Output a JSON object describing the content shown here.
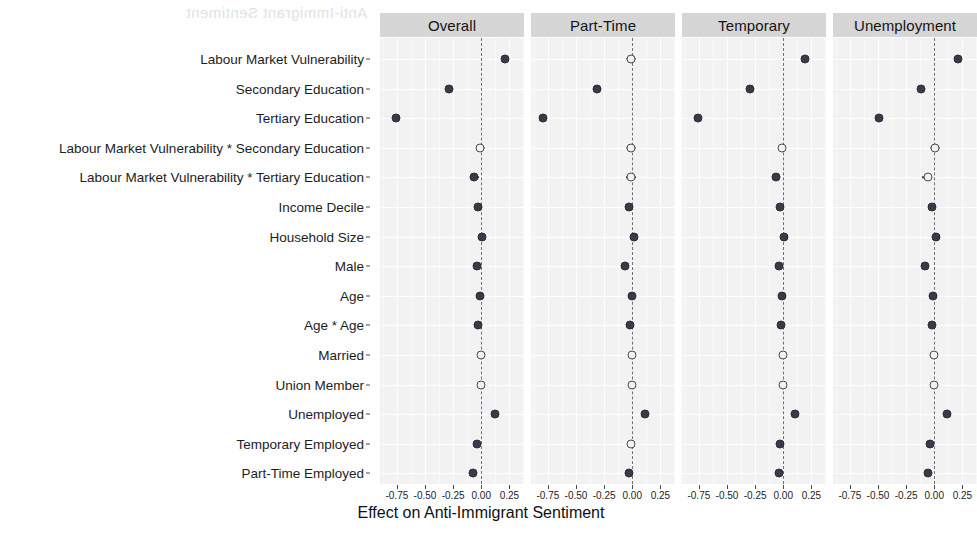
{
  "chart_data": {
    "type": "scatter",
    "plot_style": "coefficient-plot",
    "title": "",
    "xlabel": "Effect on Anti-Immigrant Sentiment",
    "ylabel": "",
    "xlim": [
      -0.9,
      0.38
    ],
    "xticks": [
      -0.75,
      -0.5,
      -0.25,
      0.0,
      0.25
    ],
    "xtick_labels": [
      "-0.75",
      "-0.50",
      "-0.25",
      "0.00",
      "0.25"
    ],
    "grid": true,
    "legend": "none",
    "reference_line": 0.0,
    "reference_line_style": "dashed",
    "marker_legend": {
      "filled": "significant",
      "open": "not significant"
    },
    "categories": [
      "Labour Market Vulnerability",
      "Secondary Education",
      "Tertiary Education",
      "Labour Market Vulnerability * Secondary Education",
      "Labour Market Vulnerability * Tertiary Education",
      "Income Decile",
      "Household Size",
      "Male",
      "Age",
      "Age * Age",
      "Married",
      "Union Member",
      "Unemployed",
      "Temporary Employed",
      "Part-Time Employed"
    ],
    "facets": [
      {
        "name": "Overall",
        "points": [
          {
            "term": "Labour Market Vulnerability",
            "estimate": 0.213,
            "ci_low": 0.185,
            "ci_high": 0.243,
            "significant": true
          },
          {
            "term": "Secondary Education",
            "estimate": -0.287,
            "ci_low": -0.305,
            "ci_high": -0.268,
            "significant": true
          },
          {
            "term": "Tertiary Education",
            "estimate": -0.755,
            "ci_low": -0.775,
            "ci_high": -0.735,
            "significant": true
          },
          {
            "term": "Labour Market Vulnerability * Secondary Education",
            "estimate": -0.011,
            "ci_low": -0.038,
            "ci_high": 0.03,
            "significant": false
          },
          {
            "term": "Labour Market Vulnerability * Tertiary Education",
            "estimate": -0.066,
            "ci_low": -0.1,
            "ci_high": -0.018,
            "significant": true
          },
          {
            "term": "Income Decile",
            "estimate": -0.03,
            "ci_low": -0.04,
            "ci_high": -0.02,
            "significant": true
          },
          {
            "term": "Household Size",
            "estimate": 0.011,
            "ci_low": 0.003,
            "ci_high": 0.02,
            "significant": true
          },
          {
            "term": "Male",
            "estimate": -0.035,
            "ci_low": -0.046,
            "ci_high": -0.024,
            "significant": true
          },
          {
            "term": "Age",
            "estimate": -0.014,
            "ci_low": -0.025,
            "ci_high": -0.004,
            "significant": true
          },
          {
            "term": "Age * Age",
            "estimate": -0.028,
            "ci_low": -0.038,
            "ci_high": -0.018,
            "significant": true
          },
          {
            "term": "Married",
            "estimate": -0.004,
            "ci_low": -0.015,
            "ci_high": 0.007,
            "significant": false
          },
          {
            "term": "Union Member",
            "estimate": -0.003,
            "ci_low": -0.015,
            "ci_high": 0.01,
            "significant": false
          },
          {
            "term": "Unemployed",
            "estimate": 0.118,
            "ci_low": 0.098,
            "ci_high": 0.14,
            "significant": true
          },
          {
            "term": "Temporary Employed",
            "estimate": -0.04,
            "ci_low": -0.055,
            "ci_high": -0.025,
            "significant": true
          },
          {
            "term": "Part-Time Employed",
            "estimate": -0.075,
            "ci_low": -0.09,
            "ci_high": -0.058,
            "significant": true
          }
        ]
      },
      {
        "name": "Part-Time",
        "points": [
          {
            "term": "Labour Market Vulnerability",
            "estimate": -0.013,
            "ci_low": -0.06,
            "ci_high": 0.035,
            "significant": false
          },
          {
            "term": "Secondary Education",
            "estimate": -0.312,
            "ci_low": -0.33,
            "ci_high": -0.293,
            "significant": true
          },
          {
            "term": "Tertiary Education",
            "estimate": -0.79,
            "ci_low": -0.81,
            "ci_high": -0.77,
            "significant": true
          },
          {
            "term": "Labour Market Vulnerability * Secondary Education",
            "estimate": -0.01,
            "ci_low": -0.055,
            "ci_high": 0.035,
            "significant": false
          },
          {
            "term": "Labour Market Vulnerability * Tertiary Education",
            "estimate": -0.012,
            "ci_low": -0.06,
            "ci_high": 0.033,
            "significant": false
          },
          {
            "term": "Income Decile",
            "estimate": -0.028,
            "ci_low": -0.038,
            "ci_high": -0.018,
            "significant": true
          },
          {
            "term": "Household Size",
            "estimate": 0.013,
            "ci_low": 0.004,
            "ci_high": 0.022,
            "significant": true
          },
          {
            "term": "Male",
            "estimate": -0.065,
            "ci_low": -0.078,
            "ci_high": -0.052,
            "significant": true
          },
          {
            "term": "Age",
            "estimate": -0.005,
            "ci_low": -0.016,
            "ci_high": 0.006,
            "significant": true
          },
          {
            "term": "Age * Age",
            "estimate": -0.022,
            "ci_low": -0.033,
            "ci_high": -0.012,
            "significant": true
          },
          {
            "term": "Married",
            "estimate": -0.002,
            "ci_low": -0.014,
            "ci_high": 0.01,
            "significant": false
          },
          {
            "term": "Union Member",
            "estimate": -0.003,
            "ci_low": -0.016,
            "ci_high": 0.01,
            "significant": false
          },
          {
            "term": "Unemployed",
            "estimate": 0.116,
            "ci_low": 0.096,
            "ci_high": 0.138,
            "significant": true
          },
          {
            "term": "Temporary Employed",
            "estimate": -0.01,
            "ci_low": -0.027,
            "ci_high": 0.008,
            "significant": false
          },
          {
            "term": "Part-Time Employed",
            "estimate": -0.027,
            "ci_low": -0.045,
            "ci_high": -0.01,
            "significant": true
          }
        ]
      },
      {
        "name": "Temporary",
        "points": [
          {
            "term": "Labour Market Vulnerability",
            "estimate": 0.193,
            "ci_low": 0.165,
            "ci_high": 0.222,
            "significant": true
          },
          {
            "term": "Secondary Education",
            "estimate": -0.295,
            "ci_low": -0.315,
            "ci_high": -0.275,
            "significant": true
          },
          {
            "term": "Tertiary Education",
            "estimate": -0.755,
            "ci_low": -0.775,
            "ci_high": -0.735,
            "significant": true
          },
          {
            "term": "Labour Market Vulnerability * Secondary Education",
            "estimate": -0.008,
            "ci_low": -0.04,
            "ci_high": 0.025,
            "significant": false
          },
          {
            "term": "Labour Market Vulnerability * Tertiary Education",
            "estimate": -0.062,
            "ci_low": -0.098,
            "ci_high": -0.03,
            "significant": true
          },
          {
            "term": "Income Decile",
            "estimate": -0.028,
            "ci_low": -0.038,
            "ci_high": -0.018,
            "significant": true
          },
          {
            "term": "Household Size",
            "estimate": 0.01,
            "ci_low": 0.002,
            "ci_high": 0.019,
            "significant": true
          },
          {
            "term": "Male",
            "estimate": -0.035,
            "ci_low": -0.047,
            "ci_high": -0.024,
            "significant": true
          },
          {
            "term": "Age",
            "estimate": -0.014,
            "ci_low": -0.025,
            "ci_high": -0.004,
            "significant": true
          },
          {
            "term": "Age * Age",
            "estimate": -0.023,
            "ci_low": -0.034,
            "ci_high": -0.013,
            "significant": true
          },
          {
            "term": "Married",
            "estimate": -0.003,
            "ci_low": -0.015,
            "ci_high": 0.009,
            "significant": false
          },
          {
            "term": "Union Member",
            "estimate": -0.003,
            "ci_low": -0.016,
            "ci_high": 0.01,
            "significant": false
          },
          {
            "term": "Unemployed",
            "estimate": 0.108,
            "ci_low": 0.088,
            "ci_high": 0.13,
            "significant": true
          },
          {
            "term": "Temporary Employed",
            "estimate": -0.03,
            "ci_low": -0.047,
            "ci_high": -0.013,
            "significant": true
          },
          {
            "term": "Part-Time Employed",
            "estimate": -0.035,
            "ci_low": -0.052,
            "ci_high": -0.018,
            "significant": true
          }
        ]
      },
      {
        "name": "Unemployment",
        "points": [
          {
            "term": "Labour Market Vulnerability",
            "estimate": 0.212,
            "ci_low": 0.182,
            "ci_high": 0.243,
            "significant": true
          },
          {
            "term": "Secondary Education",
            "estimate": -0.12,
            "ci_low": -0.142,
            "ci_high": -0.098,
            "significant": true
          },
          {
            "term": "Tertiary Education",
            "estimate": -0.495,
            "ci_low": -0.52,
            "ci_high": -0.472,
            "significant": true
          },
          {
            "term": "Labour Market Vulnerability * Secondary Education",
            "estimate": 0.005,
            "ci_low": -0.04,
            "ci_high": 0.055,
            "significant": false
          },
          {
            "term": "Labour Market Vulnerability * Tertiary Education",
            "estimate": -0.06,
            "ci_low": -0.108,
            "ci_high": -0.02,
            "significant": false
          },
          {
            "term": "Income Decile",
            "estimate": -0.022,
            "ci_low": -0.032,
            "ci_high": -0.012,
            "significant": true
          },
          {
            "term": "Household Size",
            "estimate": 0.012,
            "ci_low": 0.003,
            "ci_high": 0.021,
            "significant": true
          },
          {
            "term": "Male",
            "estimate": -0.085,
            "ci_low": -0.098,
            "ci_high": -0.072,
            "significant": true
          },
          {
            "term": "Age",
            "estimate": -0.008,
            "ci_low": -0.019,
            "ci_high": 0.003,
            "significant": true
          },
          {
            "term": "Age * Age",
            "estimate": -0.02,
            "ci_low": -0.031,
            "ci_high": -0.01,
            "significant": true
          },
          {
            "term": "Married",
            "estimate": -0.003,
            "ci_low": -0.015,
            "ci_high": 0.01,
            "significant": false
          },
          {
            "term": "Union Member",
            "estimate": -0.004,
            "ci_low": -0.017,
            "ci_high": 0.01,
            "significant": false
          },
          {
            "term": "Unemployed",
            "estimate": 0.113,
            "ci_low": 0.092,
            "ci_high": 0.135,
            "significant": true
          },
          {
            "term": "Temporary Employed",
            "estimate": -0.035,
            "ci_low": -0.052,
            "ci_high": -0.018,
            "significant": true
          },
          {
            "term": "Part-Time Employed",
            "estimate": -0.052,
            "ci_low": -0.07,
            "ci_high": -0.035,
            "significant": true
          }
        ]
      }
    ]
  },
  "colors": {
    "panel_background": "#f2f2f2",
    "strip_background": "#d6d6d6",
    "gridline": "#ffffff",
    "point_fill": "#3b3b47",
    "point_open_border": "#4a4a56",
    "zero_line": "#6f6f78",
    "text": "#1a1a1a"
  },
  "bleed_through": {
    "line1": "Anti-Immigrant Sentiment",
    "line2": "."
  }
}
